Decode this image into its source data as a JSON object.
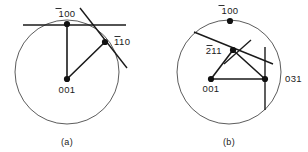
{
  "figure": {
    "type": "stereographic-projection-pair",
    "background_color": "#ffffff",
    "line_color": "#1a1a1a",
    "circle_color": "#4a4a4a",
    "pole_color": "#111111"
  },
  "panels": [
    {
      "id": "a",
      "caption": "(a)",
      "circle": {
        "cx": 67,
        "cy": 72,
        "r": 52
      },
      "poles": [
        {
          "name": "pole-1bar00",
          "label": "100",
          "overbar_chars": 1,
          "x": 67,
          "y": 24,
          "label_x": 67,
          "label_y": 16,
          "label_anchor": "middle"
        },
        {
          "name": "pole-1bar10",
          "label": "110",
          "overbar_chars": 1,
          "x": 105,
          "y": 42,
          "label_x": 114,
          "label_y": 45,
          "label_anchor": "start"
        },
        {
          "name": "pole-001",
          "label": "001",
          "overbar_chars": 0,
          "x": 67,
          "y": 79,
          "label_x": 67,
          "label_y": 93,
          "label_anchor": "middle"
        }
      ],
      "zone_lines": [
        {
          "name": "zone-001-to-100",
          "x1": 67,
          "y1": 79,
          "x2": 67,
          "y2": 24
        },
        {
          "name": "zone-001-to-110",
          "x1": 67,
          "y1": 79,
          "x2": 105,
          "y2": 42
        }
      ],
      "traces": [
        {
          "name": "trace-through-100",
          "x1": 23,
          "y1": 25,
          "x2": 126,
          "y2": 25
        },
        {
          "name": "trace-through-110",
          "x1": 80,
          "y1": 8,
          "x2": 127,
          "y2": 68
        }
      ]
    },
    {
      "id": "b",
      "caption": "(b)",
      "circle": {
        "cx": 75,
        "cy": 72,
        "r": 52
      },
      "poles": [
        {
          "name": "pole-1bar00",
          "label": "100",
          "overbar_chars": 1,
          "x": 76,
          "y": 21,
          "label_x": 76,
          "label_y": 14,
          "label_anchor": "middle"
        },
        {
          "name": "pole-2bar11",
          "label": "211",
          "overbar_chars": 1,
          "x": 79,
          "y": 50,
          "label_x": 68,
          "label_y": 54,
          "label_anchor": "end"
        },
        {
          "name": "pole-001",
          "label": "001",
          "overbar_chars": 0,
          "x": 57,
          "y": 79,
          "label_x": 57,
          "label_y": 92,
          "label_anchor": "middle"
        },
        {
          "name": "pole-031",
          "label": "031",
          "overbar_chars": 0,
          "x": 111,
          "y": 79,
          "label_x": 131,
          "label_y": 82,
          "label_anchor": "start"
        }
      ],
      "zone_lines": [
        {
          "name": "zone-001-to-211",
          "x1": 57,
          "y1": 79,
          "x2": 79,
          "y2": 50
        },
        {
          "name": "zone-001-to-031",
          "x1": 57,
          "y1": 79,
          "x2": 111,
          "y2": 79
        },
        {
          "name": "zone-211-to-031",
          "x1": 79,
          "y1": 50,
          "x2": 111,
          "y2": 79
        }
      ],
      "traces": [
        {
          "name": "trace-through-211",
          "x1": 40,
          "y1": 32,
          "x2": 119,
          "y2": 64
        },
        {
          "name": "trace-upper-through-211",
          "x1": 97,
          "y1": 40,
          "x2": 70,
          "y2": 64
        },
        {
          "name": "trace-through-031",
          "x1": 111,
          "y1": 47,
          "x2": 111,
          "y2": 110
        }
      ]
    }
  ],
  "captions": {
    "left": "(a)",
    "right": "(b)"
  }
}
